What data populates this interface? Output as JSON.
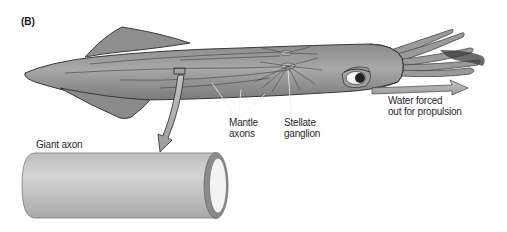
{
  "figure": {
    "panel_label": "(B)"
  },
  "labels": {
    "giant_axon": "Giant axon",
    "mantle_axons_line1": "Mantle",
    "mantle_axons_line2": "axons",
    "stellate_ganglion_line1": "Stellate",
    "stellate_ganglion_line2": "ganglion",
    "water_line1": "Water forced",
    "water_line2": "out for propulsion"
  },
  "colors": {
    "body_fill": "#9a9a9a",
    "body_dark": "#6e6e6e",
    "outline": "#3a3a3a",
    "axon_fill": "#c8c8c8",
    "axon_ring": "#8a8a8a",
    "axon_lumen": "#f4f4f4",
    "arrow_fill": "#b5b5b5"
  }
}
